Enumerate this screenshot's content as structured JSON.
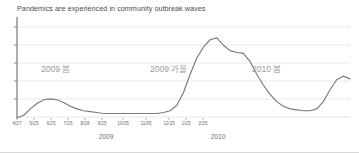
{
  "chart_data": {
    "type": "line",
    "title": "Pandemics are experienced in community outbreak waves",
    "xlabel": "",
    "ylabel": "",
    "grid": true,
    "legend": false,
    "xlim": [
      "4/27",
      "3/25"
    ],
    "ylim": [
      0,
      100
    ],
    "gridline_values": [
      20,
      40,
      60,
      80,
      100
    ],
    "tick_labels": [
      "4/27",
      "5/25",
      "6/25",
      "7/25",
      "8/28",
      "9/25",
      "10/05",
      "11/05",
      "12/25",
      "1/25",
      "2/25"
    ],
    "group_labels": [
      "2009",
      "2010"
    ],
    "annotations": [
      "2009 봄",
      "2009 가을",
      "2010 봄"
    ],
    "series": [
      {
        "name": "outbreak-waves",
        "color": "#7a7a7a",
        "x": [
          0,
          2,
          4,
          6,
          8,
          10,
          12,
          14,
          16,
          18,
          20,
          22,
          24,
          26,
          28,
          30,
          32,
          34,
          36,
          38,
          40,
          42,
          44,
          46,
          48,
          50,
          52,
          54,
          56,
          58,
          60,
          62,
          64,
          66,
          68,
          70,
          72,
          74,
          76,
          78,
          80,
          82,
          84,
          86,
          88,
          90,
          92,
          94,
          96,
          98,
          100
        ],
        "values": [
          0,
          3,
          10,
          16,
          20,
          21,
          20,
          17,
          13,
          10,
          8,
          7,
          6,
          5,
          5,
          5,
          5,
          5,
          5,
          5,
          5,
          5,
          6,
          8,
          14,
          28,
          48,
          66,
          78,
          86,
          88,
          80,
          74,
          72,
          71,
          62,
          48,
          36,
          26,
          18,
          13,
          10,
          9,
          8,
          8,
          10,
          18,
          31,
          42,
          46,
          43
        ]
      }
    ]
  },
  "axis": {
    "tick_positions": [
      17,
      34,
      51,
      68,
      85,
      102,
      123,
      146,
      169,
      186,
      203
    ],
    "year_positions": [
      106,
      218
    ]
  }
}
